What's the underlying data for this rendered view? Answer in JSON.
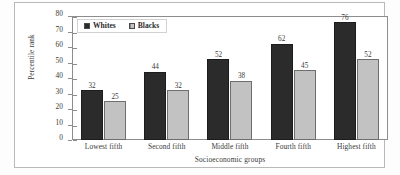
{
  "chart_data": {
    "type": "bar",
    "title": "",
    "subtitle": "",
    "xlabel": "Socioeconomic groups",
    "ylabel": "Percentile rank",
    "categories": [
      "Lowest fifth",
      "Second fifth",
      "Middle fifth",
      "Fourth fifth",
      "Highest fifth"
    ],
    "series": [
      {
        "name": "Whites",
        "color": "#2b2b2b",
        "values": [
          32,
          44,
          52,
          62,
          76
        ]
      },
      {
        "name": "Blacks",
        "color": "#c2c2c2",
        "values": [
          25,
          32,
          38,
          45,
          52
        ]
      }
    ],
    "ylim": [
      0,
      80
    ],
    "yticks": [
      80,
      70,
      60,
      50,
      40,
      30,
      20,
      10,
      0
    ],
    "grid": false,
    "legend_position": "top-left",
    "data_labels": true
  },
  "legend": {
    "entries": [
      {
        "label": "Whites",
        "swatch": "filled-dark-square-icon"
      },
      {
        "label": "Blacks",
        "swatch": "hatched-light-square-icon"
      }
    ]
  }
}
